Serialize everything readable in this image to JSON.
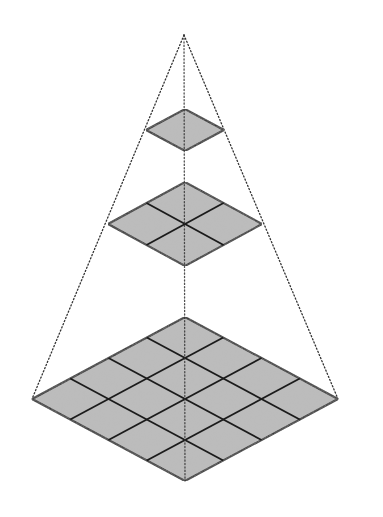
{
  "diagram": {
    "type": "image-pyramid",
    "apex": {
      "x": 184,
      "y": 35
    },
    "colors": {
      "background": "#ffffff",
      "fill": "#bcbcbc",
      "grid_line": "#1b1b1b",
      "guide_line": "#333333"
    },
    "levels": [
      {
        "name": "top-level",
        "grid": 1,
        "center": {
          "x": 185,
          "y": 130
        },
        "half_width": 39,
        "half_height": 21
      },
      {
        "name": "middle-level",
        "grid": 2,
        "center": {
          "x": 185,
          "y": 224
        },
        "half_width": 77,
        "half_height": 42
      },
      {
        "name": "bottom-level",
        "grid": 4,
        "center": {
          "x": 185,
          "y": 399
        },
        "half_width": 153,
        "half_height": 82
      }
    ]
  }
}
